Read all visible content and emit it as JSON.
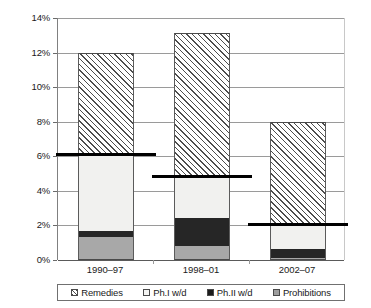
{
  "chart_data": {
    "type": "bar",
    "stacked": true,
    "title": "",
    "xlabel": "",
    "ylabel": "",
    "categories": [
      "1990–97",
      "1998–01",
      "2002–07"
    ],
    "ylim": [
      0,
      14
    ],
    "ytick_values": [
      0,
      2,
      4,
      6,
      8,
      10,
      12,
      14
    ],
    "ytick_labels": [
      "0%",
      "2%",
      "4%",
      "6%",
      "8%",
      "10%",
      "12%",
      "14%"
    ],
    "grid": true,
    "legend_position": "bottom",
    "series": [
      {
        "name": "Prohibitions",
        "key": "prohibitions",
        "color": "#a8a8a8",
        "pattern": "solid-gray",
        "values": [
          1.32,
          0.81,
          0.1
        ]
      },
      {
        "name": "Ph.II w/d",
        "key": "ph2",
        "color": "#262626",
        "pattern": "solid-black",
        "values": [
          0.35,
          1.63,
          0.55
        ]
      },
      {
        "name": "Ph.I w/d",
        "key": "ph1",
        "color": "#f1f1ef",
        "pattern": "solid-white",
        "values": [
          4.43,
          2.41,
          1.4
        ]
      },
      {
        "name": "Remedies",
        "key": "remedies",
        "color": "#4d4d4d",
        "pattern": "diagonal-hatch",
        "values": [
          5.9,
          8.3,
          5.95
        ]
      }
    ],
    "legend_order": [
      "Remedies",
      "Ph.I w/d",
      "Ph.II w/d",
      "Prohibitions"
    ],
    "totals": [
      12.0,
      13.15,
      8.0
    ],
    "markers": {
      "name": "reference-level",
      "color": "#000000",
      "values": [
        6.13,
        4.88,
        2.07
      ]
    }
  }
}
